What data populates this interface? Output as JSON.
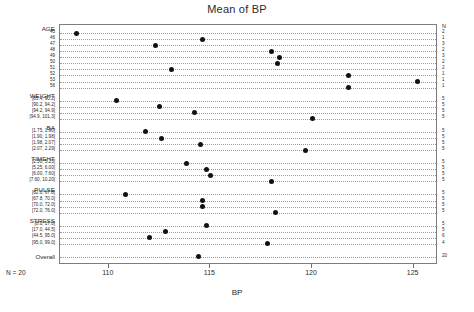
{
  "chart_data": {
    "type": "scatter",
    "title": "Mean of BP",
    "xlabel": "BP",
    "ylabel": "",
    "xlim": [
      107.6,
      126.2
    ],
    "xticks": [
      110,
      115,
      120,
      125
    ],
    "xtick_labels": [
      "110",
      "115",
      "120",
      "125"
    ],
    "grid": "dotted-row-leaders",
    "legend": "none",
    "n_column_header": "N",
    "n_note": "N = 20",
    "groups": [
      {
        "name": "AGE",
        "levels": [
          {
            "label": "45",
            "value": 108.4,
            "n": "2"
          },
          {
            "label": "46",
            "value": 114.6,
            "n": "1"
          },
          {
            "label": "47",
            "value": 112.3,
            "n": "3"
          },
          {
            "label": "48",
            "value": 118.0,
            "n": "2"
          },
          {
            "label": "49",
            "value": 118.4,
            "n": "3"
          },
          {
            "label": "50",
            "value": 118.3,
            "n": "2"
          },
          {
            "label": "51",
            "value": 113.1,
            "n": "2"
          },
          {
            "label": "52",
            "value": 121.8,
            "n": "1"
          },
          {
            "label": "53",
            "value": 125.2,
            "n": "1"
          },
          {
            "label": "56",
            "value": 121.8,
            "n": "1"
          }
        ]
      },
      {
        "name": "WEIGHT",
        "levels": [
          {
            "label": "[85.4, 90.2]",
            "value": 110.4,
            "n": "5"
          },
          {
            "label": "[90.2, 94.2]",
            "value": 112.5,
            "n": "5"
          },
          {
            "label": "[94.2, 94.9]",
            "value": 114.2,
            "n": "5"
          },
          {
            "label": "[94.9, 101.3]",
            "value": 120.0,
            "n": "5"
          }
        ]
      },
      {
        "name": "BA",
        "levels": [
          {
            "label": "[1.75, 1.90]",
            "value": 111.8,
            "n": "5"
          },
          {
            "label": "[1.90, 1.98]",
            "value": 112.6,
            "n": "5"
          },
          {
            "label": "[1.98, 2.07]",
            "value": 114.5,
            "n": "5"
          },
          {
            "label": "[2.07, 2.29]",
            "value": 119.7,
            "n": "5"
          }
        ]
      },
      {
        "name": "TIMEHT",
        "levels": [
          {
            "label": "[2.50, 5.25]",
            "value": 113.8,
            "n": "5"
          },
          {
            "label": "[5.25, 6.00]",
            "value": 114.8,
            "n": "5"
          },
          {
            "label": "[6.00, 7.60]",
            "value": 115.0,
            "n": "5"
          },
          {
            "label": "[7.60, 10.20]",
            "value": 118.0,
            "n": "5"
          }
        ]
      },
      {
        "name": "PULSE",
        "levels": [
          {
            "label": "[62.0, 67.8]",
            "value": 110.8,
            "n": "5"
          },
          {
            "label": "[67.8, 70.0]",
            "value": 114.6,
            "n": "5"
          },
          {
            "label": "[70.0, 72.0]",
            "value": 114.6,
            "n": "5"
          },
          {
            "label": "[72.0, 76.0]",
            "value": 118.2,
            "n": "5"
          }
        ]
      },
      {
        "name": "STRESS",
        "levels": [
          {
            "label": "[8.0, 17.0]",
            "value": 114.8,
            "n": "5"
          },
          {
            "label": "[17.0, 44.5]",
            "value": 112.8,
            "n": "5"
          },
          {
            "label": "[44.5, 95.0]",
            "value": 112.0,
            "n": "6"
          },
          {
            "label": "[95.0, 99.0]",
            "value": 117.8,
            "n": "4"
          }
        ]
      },
      {
        "name": "Overall",
        "levels": [
          {
            "label": "",
            "value": 114.4,
            "n": "20"
          }
        ]
      }
    ]
  }
}
